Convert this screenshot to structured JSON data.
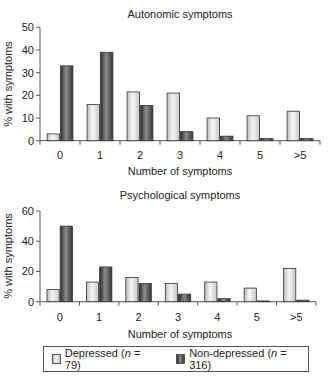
{
  "legend": {
    "items": [
      {
        "name": "Depressed",
        "n_label": "n",
        "n_value": "79",
        "text_prefix": "Depressed (",
        "text_suffix": " = 79)"
      },
      {
        "name": "Non-depressed",
        "n_label": "n",
        "n_value": "316",
        "text_prefix": "Non-depressed (",
        "text_suffix": " = 316)"
      }
    ]
  },
  "colors": {
    "depressed_fill": "#e6e6e6",
    "non_depressed_fill": "#555555",
    "axis": "#555555"
  },
  "chart_data": [
    {
      "type": "bar",
      "title": "Autonomic symptoms",
      "xlabel": "Number of symptoms",
      "ylabel": "% with symptoms",
      "ylim": [
        0,
        50
      ],
      "yticks": [
        0,
        10,
        20,
        30,
        40,
        50
      ],
      "categories": [
        "0",
        "1",
        "2",
        "3",
        "4",
        "5",
        ">5"
      ],
      "series": [
        {
          "name": "Depressed (n = 79)",
          "values": [
            3,
            16,
            21.5,
            21,
            10,
            11,
            13
          ]
        },
        {
          "name": "Non-depressed (n = 316)",
          "values": [
            33,
            39,
            15.5,
            4,
            2,
            1,
            1
          ]
        }
      ],
      "grid": false,
      "legend_position": "bottom (shared)"
    },
    {
      "type": "bar",
      "title": "Psychological symptoms",
      "xlabel": "Number of symptoms",
      "ylabel": "% with symptoms",
      "ylim": [
        0,
        60
      ],
      "yticks": [
        0,
        20,
        40,
        60
      ],
      "categories": [
        "0",
        "1",
        "2",
        "3",
        "4",
        "5",
        ">5"
      ],
      "series": [
        {
          "name": "Depressed (n = 79)",
          "values": [
            8,
            13,
            16,
            12,
            13,
            9,
            22
          ]
        },
        {
          "name": "Non-depressed (n = 316)",
          "values": [
            50,
            23,
            12,
            5,
            2,
            0.5,
            1
          ]
        }
      ],
      "grid": false,
      "legend_position": "bottom (shared)"
    }
  ]
}
